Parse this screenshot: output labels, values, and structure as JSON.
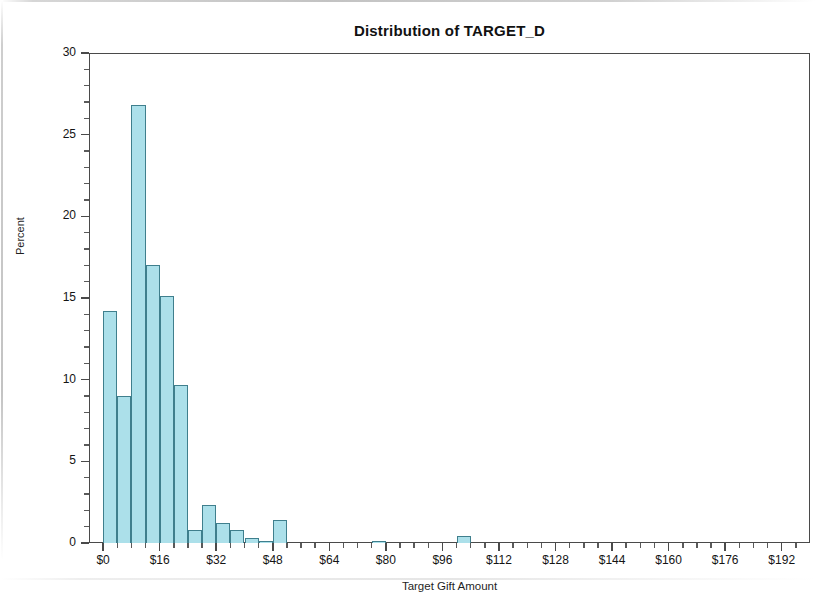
{
  "chart_data": {
    "type": "bar",
    "title": "Distribution of TARGET_D",
    "xlabel": "Target Gift Amount",
    "ylabel": "Percent",
    "xlim": [
      -4,
      200
    ],
    "ylim": [
      0,
      30
    ],
    "grid": false,
    "legend": null,
    "bin_width": 4,
    "x_tick_labels": [
      "$0",
      "$16",
      "$32",
      "$48",
      "$64",
      "$80",
      "$96",
      "$112",
      "$128",
      "$144",
      "$160",
      "$176",
      "$192"
    ],
    "x_tick_values": [
      0,
      16,
      32,
      48,
      64,
      80,
      96,
      112,
      128,
      144,
      160,
      176,
      192
    ],
    "y_tick_labels": [
      "0",
      "5",
      "10",
      "15",
      "20",
      "25",
      "30"
    ],
    "y_tick_values": [
      0,
      5,
      10,
      15,
      20,
      25,
      30
    ],
    "bins": [
      {
        "center": 2,
        "left": 0,
        "right": 4,
        "value": 14.2
      },
      {
        "center": 6,
        "left": 4,
        "right": 8,
        "value": 9.0
      },
      {
        "center": 10,
        "left": 8,
        "right": 12,
        "value": 26.8
      },
      {
        "center": 14,
        "left": 12,
        "right": 16,
        "value": 17.0
      },
      {
        "center": 18,
        "left": 16,
        "right": 20,
        "value": 15.1
      },
      {
        "center": 22,
        "left": 20,
        "right": 24,
        "value": 9.7
      },
      {
        "center": 26,
        "left": 24,
        "right": 28,
        "value": 0.8
      },
      {
        "center": 30,
        "left": 28,
        "right": 32,
        "value": 2.3
      },
      {
        "center": 34,
        "left": 32,
        "right": 36,
        "value": 1.2
      },
      {
        "center": 38,
        "left": 36,
        "right": 40,
        "value": 0.8
      },
      {
        "center": 42,
        "left": 40,
        "right": 44,
        "value": 0.3
      },
      {
        "center": 46,
        "left": 44,
        "right": 48,
        "value": 0.1
      },
      {
        "center": 50,
        "left": 48,
        "right": 52,
        "value": 1.4
      },
      {
        "center": 78,
        "left": 76,
        "right": 80,
        "value": 0.15
      },
      {
        "center": 102,
        "left": 100,
        "right": 104,
        "value": 0.45
      }
    ],
    "colors": {
      "bar_fill": "#ACE0EA",
      "bar_border": "#3F7F8D",
      "axis": "#4A4A4A",
      "text": "#141414",
      "background": "#FFFFFF"
    }
  }
}
